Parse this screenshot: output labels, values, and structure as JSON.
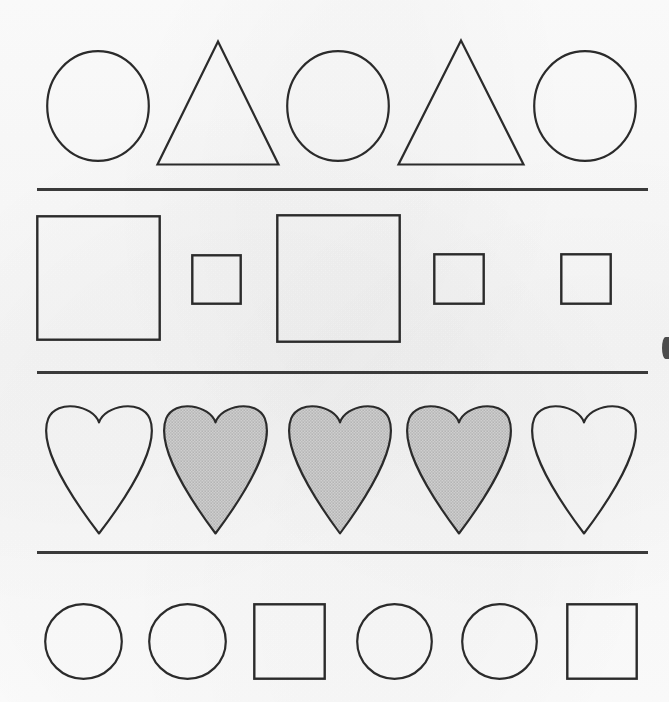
{
  "page": {
    "width": 669,
    "height": 702,
    "background_color": "#fbfbfb",
    "stroke_color": "#2b2b2b",
    "fill_pattern_color": "#8a8a8a",
    "fill_pattern_background": "#efefef",
    "divider_color": "#3a3a3a"
  },
  "rows": [
    {
      "name": "row-1-circles-triangles",
      "index": 1,
      "shape_count": 5,
      "shapes": [
        {
          "type": "circle",
          "label": "circle",
          "filled": false,
          "x": 46,
          "y": 50,
          "width": 104,
          "height": 112
        },
        {
          "type": "triangle",
          "label": "triangle",
          "filled": false,
          "x": 156,
          "y": 40,
          "width": 124,
          "height": 126
        },
        {
          "type": "circle",
          "label": "circle",
          "filled": false,
          "x": 286,
          "y": 50,
          "width": 104,
          "height": 112
        },
        {
          "type": "triangle",
          "label": "triangle",
          "filled": false,
          "x": 397,
          "y": 39,
          "width": 128,
          "height": 127
        },
        {
          "type": "circle",
          "label": "circle",
          "filled": false,
          "x": 533,
          "y": 50,
          "width": 104,
          "height": 112
        }
      ]
    },
    {
      "name": "row-2-squares",
      "index": 2,
      "shape_count": 5,
      "shapes": [
        {
          "type": "square",
          "label": "large square",
          "filled": false,
          "x": 36,
          "y": 215,
          "width": 125,
          "height": 126
        },
        {
          "type": "square",
          "label": "small square",
          "filled": false,
          "x": 191,
          "y": 254,
          "width": 51,
          "height": 51
        },
        {
          "type": "square",
          "label": "large square",
          "filled": false,
          "x": 276,
          "y": 214,
          "width": 125,
          "height": 129
        },
        {
          "type": "square",
          "label": "small square",
          "filled": false,
          "x": 433,
          "y": 253,
          "width": 52,
          "height": 52
        },
        {
          "type": "square",
          "label": "small square",
          "filled": false,
          "x": 560,
          "y": 253,
          "width": 52,
          "height": 52
        }
      ]
    },
    {
      "name": "row-3-hearts",
      "index": 3,
      "shape_count": 5,
      "shapes": [
        {
          "type": "heart",
          "label": "heart",
          "filled": false,
          "x": 43,
          "y": 399,
          "width": 112,
          "height": 136
        },
        {
          "type": "heart",
          "label": "shaded heart",
          "filled": true,
          "x": 161,
          "y": 399,
          "width": 109,
          "height": 136
        },
        {
          "type": "heart",
          "label": "shaded heart",
          "filled": true,
          "x": 286,
          "y": 399,
          "width": 108,
          "height": 136
        },
        {
          "type": "heart",
          "label": "shaded heart",
          "filled": true,
          "x": 404,
          "y": 399,
          "width": 110,
          "height": 136
        },
        {
          "type": "heart",
          "label": "heart",
          "filled": false,
          "x": 529,
          "y": 399,
          "width": 110,
          "height": 136
        }
      ]
    },
    {
      "name": "row-4-circles-squares",
      "index": 4,
      "shape_count": 6,
      "shapes": [
        {
          "type": "circle",
          "label": "circle",
          "filled": false,
          "x": 44,
          "y": 603,
          "width": 79,
          "height": 77
        },
        {
          "type": "circle",
          "label": "circle",
          "filled": false,
          "x": 148,
          "y": 603,
          "width": 79,
          "height": 77
        },
        {
          "type": "square",
          "label": "square",
          "filled": false,
          "x": 253,
          "y": 603,
          "width": 73,
          "height": 77
        },
        {
          "type": "circle",
          "label": "circle",
          "filled": false,
          "x": 356,
          "y": 603,
          "width": 77,
          "height": 77
        },
        {
          "type": "circle",
          "label": "circle",
          "filled": false,
          "x": 461,
          "y": 603,
          "width": 77,
          "height": 77
        },
        {
          "type": "square",
          "label": "square",
          "filled": false,
          "x": 566,
          "y": 603,
          "width": 72,
          "height": 77
        }
      ]
    }
  ],
  "dividers": [
    {
      "name": "divider-1",
      "x": 37,
      "y": 188,
      "width": 611
    },
    {
      "name": "divider-2",
      "x": 37,
      "y": 371,
      "width": 611
    },
    {
      "name": "divider-3",
      "x": 37,
      "y": 551,
      "width": 611
    }
  ]
}
